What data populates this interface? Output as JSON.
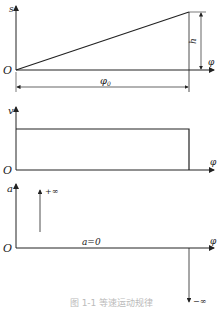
{
  "diagram": {
    "caption": "图 1-1  等速运动规律",
    "panels": [
      {
        "y_label": "s",
        "x_label": "φ",
        "origin": "O",
        "height_label": "h",
        "span_label": "φ0",
        "shape": "linear ramp from 0 to h over φ0"
      },
      {
        "y_label": "v",
        "x_label": "φ",
        "origin": "O",
        "shape": "constant velocity over φ0"
      },
      {
        "y_label": "a",
        "x_label": "φ",
        "origin": "O",
        "zero_label": "a=0",
        "plus_inf": "+∞",
        "minus_inf": "−∞",
        "shape": "zero acceleration with impulses at ends"
      }
    ]
  },
  "labels": {
    "s": "s",
    "v": "v",
    "a": "a",
    "phi": "φ",
    "o": "O",
    "h": "h",
    "phi0": "φ",
    "phi0_sub": "0",
    "a0": "a=0",
    "plusinf": "+∞",
    "minusinf": "−∞"
  }
}
